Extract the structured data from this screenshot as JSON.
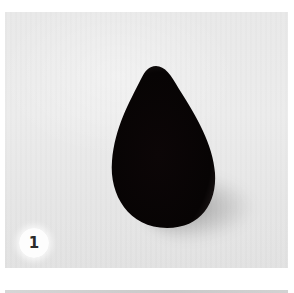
{
  "figure": {
    "step_number": "1",
    "colors": {
      "background": "#e9e9e9",
      "object": "#0a0505",
      "badge": "#ffffff",
      "badge_text": "#2a2a2a"
    }
  }
}
